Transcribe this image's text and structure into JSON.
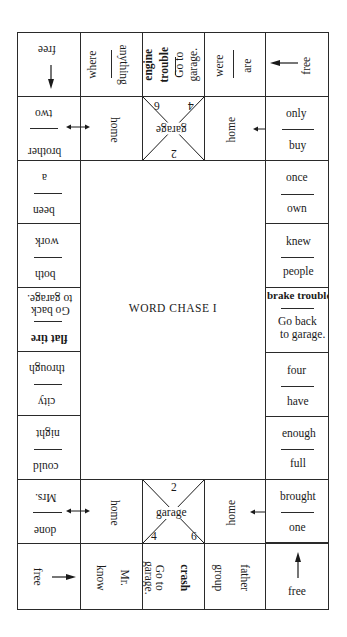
{
  "title": "WORD CHASE I",
  "top_row": {
    "c0": {
      "label": "free"
    },
    "c1": {
      "top": "where",
      "bottom": "anything"
    },
    "c2": {
      "bold1": "engine",
      "bold2": "trouble",
      "line1": "Go to",
      "line2": "garage."
    },
    "c3": {
      "top": "were",
      "bottom": "are"
    },
    "c4": {
      "label": "free"
    }
  },
  "second_row": {
    "c0": {
      "top": "two",
      "bottom": "brother"
    },
    "c1": {
      "label": "home"
    },
    "garage": {
      "label": "garage",
      "n_top_left": "6",
      "n_top_right": "4",
      "n_bottom": "2"
    },
    "c3": {
      "label": "home"
    },
    "c4": {
      "top": "only",
      "bottom": "buy"
    }
  },
  "left_column": [
    {
      "top": "a",
      "bottom": "been"
    },
    {
      "top": "work",
      "bottom": "both"
    },
    {
      "top_l1": "to garage.",
      "top_l2": "Go back",
      "bottom": "flat tire"
    },
    {
      "top": "through",
      "bottom": "city"
    },
    {
      "top": "night",
      "bottom": "could"
    }
  ],
  "right_column": [
    {
      "top": "once",
      "bottom": "own"
    },
    {
      "top": "knew",
      "bottom": "people"
    },
    {
      "top": "brake trouble",
      "bottom_l1": "Go back",
      "bottom_l2": "to garage."
    },
    {
      "top": "four",
      "bottom": "have"
    },
    {
      "top": "enough",
      "bottom": "full"
    }
  ],
  "fourth_row": {
    "c0": {
      "top": "Mrs.",
      "bottom": "done"
    },
    "c1": {
      "label": "home"
    },
    "garage": {
      "label": "garage",
      "n_top": "2",
      "n_bottom_left": "4",
      "n_bottom_right": "6"
    },
    "c3": {
      "label": "home"
    },
    "c4": {
      "top": "brought",
      "bottom": "one"
    }
  },
  "bottom_row": {
    "c0": {
      "label": "free"
    },
    "c1": {
      "left": "know",
      "right": "Mr."
    },
    "c2": {
      "line1": "garage.",
      "line2": "Go to",
      "bold": "crash"
    },
    "c3": {
      "left": "group",
      "right": "father"
    },
    "c4": {
      "label": "free"
    }
  },
  "colors": {
    "ink": "#1a1a1a",
    "paper": "#ffffff"
  }
}
